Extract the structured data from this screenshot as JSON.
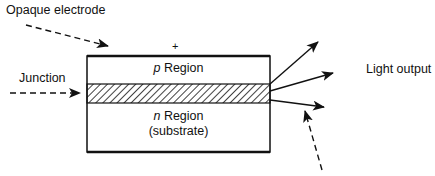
{
  "labels": {
    "electrode": "Opaque electrode",
    "junction": "Junction",
    "plus": "+",
    "p_letter": "p",
    "p_region": " Region",
    "n_letter": "n",
    "n_region": " Region",
    "substrate": "(substrate)",
    "light_output": "Light output"
  },
  "colors": {
    "stroke": "#111111",
    "background": "#ffffff"
  }
}
